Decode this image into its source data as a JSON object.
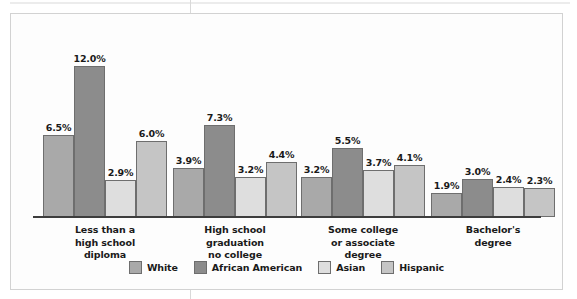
{
  "chart_data": {
    "type": "bar",
    "title": "",
    "subtitle": "",
    "xlabel": "",
    "ylabel": "",
    "ylim": [
      0,
      12.6
    ],
    "grid": false,
    "legend_position": "bottom-center",
    "value_suffix": "%",
    "categories": [
      "Less than a\nhigh school\ndiploma",
      "High school\ngraduation\nno college",
      "Some college\nor associate\ndegree",
      "Bachelor's\ndegree"
    ],
    "category_lines": [
      [
        "Less than a",
        "high school",
        "diploma"
      ],
      [
        "High school",
        "graduation",
        "no college"
      ],
      [
        "Some college",
        "or associate",
        "degree"
      ],
      [
        "Bachelor's",
        "degree"
      ]
    ],
    "series": [
      {
        "name": "White",
        "color": "#a9a9a9",
        "values": [
          6.5,
          3.9,
          3.2,
          1.9
        ],
        "labels": [
          "6.5%",
          "3.9%",
          "3.2%",
          "1.9%"
        ]
      },
      {
        "name": "African American",
        "color": "#8c8c8c",
        "values": [
          12.0,
          7.3,
          5.5,
          3.0
        ],
        "labels": [
          "12.0%",
          "7.3%",
          "5.5%",
          "3.0%"
        ]
      },
      {
        "name": "Asian",
        "color": "#dedede",
        "values": [
          2.9,
          3.2,
          3.7,
          2.4
        ],
        "labels": [
          "2.9%",
          "3.2%",
          "3.7%",
          "2.4%"
        ]
      },
      {
        "name": "Hispanic",
        "color": "#c5c5c5",
        "values": [
          6.0,
          4.4,
          4.1,
          2.3
        ],
        "labels": [
          "6.0%",
          "4.4%",
          "4.1%",
          "2.3%"
        ]
      }
    ]
  },
  "legend": {
    "items": [
      {
        "label": "White",
        "color": "#a9a9a9"
      },
      {
        "label": "African American",
        "color": "#8c8c8c"
      },
      {
        "label": "Asian",
        "color": "#dedede"
      },
      {
        "label": "Hispanic",
        "color": "#c5c5c5"
      }
    ]
  },
  "style": {
    "bar_border": "#6e6e6e",
    "axis_color": "#3d3d3d",
    "frame_border": "#d2d2d2",
    "text_color": "#1a1a1a",
    "background": "#fdfdfd"
  }
}
